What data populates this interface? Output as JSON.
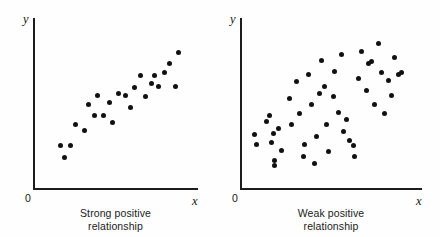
{
  "figure": {
    "background_color": "#fefefe",
    "ink_color": "#111111"
  },
  "panels": [
    {
      "id": "left",
      "caption_line1": "Strong positive",
      "caption_line2": "relationship",
      "x_axis_label": "x",
      "y_axis_label": "y",
      "origin_label": "0"
    },
    {
      "id": "right",
      "caption_line1": "Weak positive",
      "caption_line2": "relationship",
      "x_axis_label": "x",
      "y_axis_label": "y",
      "origin_label": "0"
    }
  ],
  "chart_data": [
    {
      "type": "scatter",
      "title": "Strong positive relationship",
      "xlabel": "x",
      "ylabel": "y",
      "grid": false,
      "legend": null,
      "xlim": [
        0,
        100
      ],
      "ylim": [
        0,
        100
      ],
      "axis_tick_labels": {
        "origin": "0"
      },
      "n_points": 24,
      "points": [
        [
          13,
          24
        ],
        [
          16,
          16
        ],
        [
          20,
          24
        ],
        [
          23,
          38
        ],
        [
          29,
          34
        ],
        [
          32,
          51
        ],
        [
          36,
          44
        ],
        [
          38,
          57
        ],
        [
          42,
          44
        ],
        [
          46,
          52
        ],
        [
          48,
          39
        ],
        [
          52,
          58
        ],
        [
          57,
          57
        ],
        [
          60,
          49
        ],
        [
          63,
          62
        ],
        [
          67,
          70
        ],
        [
          70,
          56
        ],
        [
          74,
          65
        ],
        [
          76,
          70
        ],
        [
          79,
          63
        ],
        [
          83,
          72
        ],
        [
          86,
          78
        ],
        [
          90,
          63
        ],
        [
          92,
          85
        ]
      ]
    },
    {
      "type": "scatter",
      "title": "Weak positive relationship",
      "xlabel": "x",
      "ylabel": "y",
      "grid": false,
      "legend": null,
      "xlim": [
        0,
        100
      ],
      "ylim": [
        0,
        100
      ],
      "axis_tick_labels": {
        "origin": "0"
      },
      "n_points": 48,
      "points": [
        [
          4,
          31
        ],
        [
          5,
          25
        ],
        [
          11,
          40
        ],
        [
          13,
          44
        ],
        [
          14,
          26
        ],
        [
          15,
          32
        ],
        [
          16,
          14
        ],
        [
          16,
          11
        ],
        [
          18,
          35
        ],
        [
          20,
          21
        ],
        [
          25,
          55
        ],
        [
          26,
          38
        ],
        [
          29,
          66
        ],
        [
          31,
          45
        ],
        [
          33,
          17
        ],
        [
          34,
          25
        ],
        [
          36,
          71
        ],
        [
          38,
          51
        ],
        [
          40,
          12
        ],
        [
          41,
          30
        ],
        [
          43,
          58
        ],
        [
          44,
          80
        ],
        [
          46,
          63
        ],
        [
          47,
          38
        ],
        [
          48,
          20
        ],
        [
          51,
          56
        ],
        [
          52,
          73
        ],
        [
          54,
          46
        ],
        [
          56,
          84
        ],
        [
          57,
          33
        ],
        [
          59,
          41
        ],
        [
          61,
          27
        ],
        [
          63,
          24
        ],
        [
          64,
          17
        ],
        [
          66,
          68
        ],
        [
          68,
          86
        ],
        [
          71,
          60
        ],
        [
          72,
          78
        ],
        [
          74,
          79
        ],
        [
          76,
          51
        ],
        [
          78,
          91
        ],
        [
          80,
          72
        ],
        [
          82,
          45
        ],
        [
          84,
          67
        ],
        [
          86,
          57
        ],
        [
          88,
          82
        ],
        [
          90,
          71
        ],
        [
          92,
          72
        ]
      ]
    }
  ]
}
